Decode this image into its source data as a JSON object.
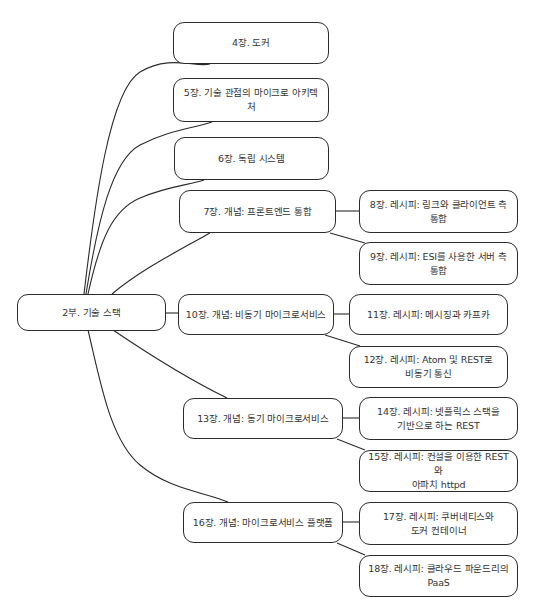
{
  "diagram": {
    "type": "mind-map",
    "root": {
      "id": "root",
      "label": "2부. 기술 스택"
    },
    "nodes": [
      {
        "id": "n4",
        "label": "4장. 도커",
        "parent": "root"
      },
      {
        "id": "n5",
        "label": "5장. 기술 관점의 마이크로 아키텍처",
        "parent": "root"
      },
      {
        "id": "n6",
        "label": "6장. 독립 시스템",
        "parent": "root"
      },
      {
        "id": "n7",
        "label": "7장. 개념: 프론트엔드 통합",
        "parent": "root"
      },
      {
        "id": "n8",
        "label": "8장. 레시피: 링크와 클라이언트 측 통합",
        "parent": "n7"
      },
      {
        "id": "n9",
        "label": "9장. 레시피: ESI를 사용한 서버 측 통합",
        "parent": "n7"
      },
      {
        "id": "n10",
        "label": "10장. 개념: 비동기 마이크로서비스",
        "parent": "root"
      },
      {
        "id": "n11",
        "label": "11장. 레시피: 메시징과 카프카",
        "parent": "n10"
      },
      {
        "id": "n12",
        "label": "12장. 레시피: Atom 및 REST로\n비동기 통신",
        "parent": "n10"
      },
      {
        "id": "n13",
        "label": "13장. 개념: 동기 마이크로서비스",
        "parent": "root"
      },
      {
        "id": "n14",
        "label": "14장. 레시피: 넷플릭스 스택을\n기반으로 하는 REST",
        "parent": "n13"
      },
      {
        "id": "n15",
        "label": "15장. 레시피: 컨설을 이용한 REST와\n아파치 httpd",
        "parent": "n13"
      },
      {
        "id": "n16",
        "label": "16장. 개념: 마이크로서비스 플랫폼",
        "parent": "root"
      },
      {
        "id": "n17",
        "label": "17장. 레시피: 쿠버네티스와\n도커 컨테이너",
        "parent": "n16"
      },
      {
        "id": "n18",
        "label": "18장. 레시피: 클라우드 파운드리의\nPaaS",
        "parent": "n16"
      }
    ],
    "colors": {
      "border": "#2b2b2b",
      "line": "#2a2a2a",
      "text": "#333333",
      "background": "#ffffff"
    }
  }
}
